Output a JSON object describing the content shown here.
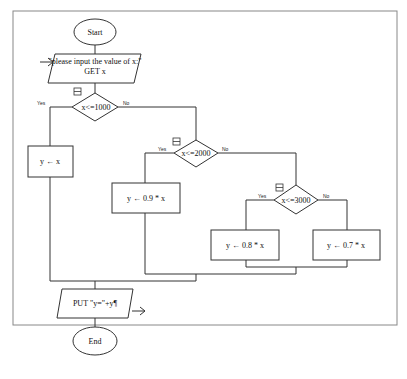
{
  "flowchart": {
    "start": {
      "label": "Start"
    },
    "input": {
      "line1": "\"please input the value of x:\"",
      "line2": "GET x"
    },
    "decision1": {
      "label": "x<=1000",
      "yes": "Yes",
      "no": "No"
    },
    "process1": {
      "label": "y ← x"
    },
    "decision2": {
      "label": "x<=2000",
      "yes": "Yes",
      "no": "No"
    },
    "process2": {
      "label": "y ← 0.9 * x"
    },
    "decision3": {
      "label": "x<=3000",
      "yes": "Yes",
      "no": "No"
    },
    "process3": {
      "label": "y ← 0.8 * x"
    },
    "process4": {
      "label": "y ← 0.7 * x"
    },
    "output": {
      "label": "PUT \"y=\"+y¶"
    },
    "end": {
      "label": "End"
    }
  }
}
